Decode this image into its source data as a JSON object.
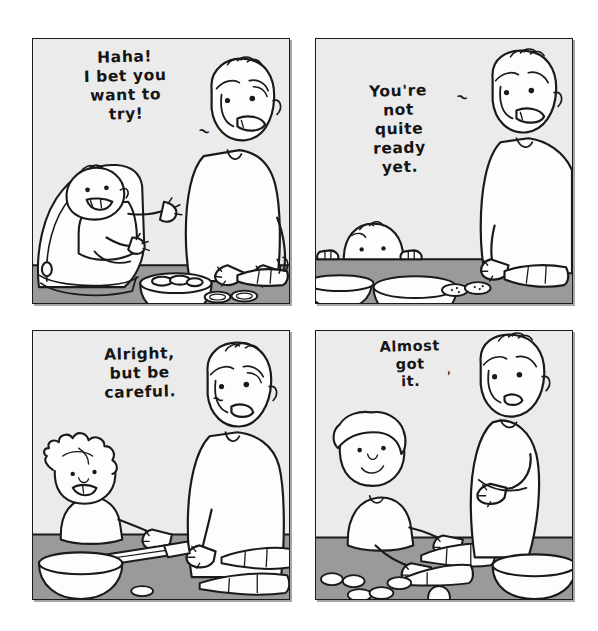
{
  "comic": {
    "title": "Haha! I bet you want to try!",
    "medium": "black-and-white hand-drawn four-panel comic strip",
    "page_background": "#ffffff",
    "colors": {
      "wall": "#ebebeb",
      "counter": "#9a9a9a",
      "ink": "#1a1a1a",
      "fill_white": "#fdfdfd",
      "panel_border": "#1a1a1a"
    },
    "layout": {
      "rows": 2,
      "columns": 2,
      "panel_count": 4,
      "gutter_px": 25
    },
    "panels": [
      {
        "index": 1,
        "position": "top-left",
        "speech_text": "Haha!\nI bet you\nwant to\ntry!",
        "speech_tail": "~",
        "speaker": "father",
        "scene_description": "Father stands at the kitchen counter slicing vegetables while a laughing baby sits in a bouncer seat beside him, arms outstretched.",
        "characters": [
          "father",
          "baby-in-bouncer"
        ],
        "props": [
          "bowl-of-slices",
          "cutting-board-slices",
          "carrot"
        ]
      },
      {
        "index": 2,
        "position": "top-right",
        "speech_text": "You're\nnot\nquite\nready\nyet.",
        "speech_tail": "~",
        "speaker": "father",
        "scene_description": "Father leans over the counter chopping a carrot; only the top of the toddler's head and two little hands peek over the counter edge.",
        "characters": [
          "father",
          "toddler-peeking"
        ],
        "props": [
          "bowl",
          "plate",
          "carrot-slices",
          "carrot"
        ]
      },
      {
        "index": 3,
        "position": "bottom-left",
        "speech_text": "Alright,\nbut be\ncareful.",
        "speech_tail": "~",
        "speaker": "father",
        "scene_description": "A grinning young child with messy hair reaches for a knife on the counter; the father guides the knife with his hand from the other side.",
        "characters": [
          "father",
          "young-child"
        ],
        "props": [
          "knife",
          "bowl",
          "carrots"
        ]
      },
      {
        "index": 4,
        "position": "bottom-right",
        "speech_text": "Almost\ngot\nit.",
        "speech_tail": "`",
        "speaker": "child",
        "scene_description": "An older child cuts a carrot with a knife while the father stands back with his arms crossed, watching.",
        "characters": [
          "father-arms-crossed",
          "older-child"
        ],
        "props": [
          "knife",
          "carrot",
          "carrot-slices",
          "bowl"
        ]
      }
    ]
  }
}
